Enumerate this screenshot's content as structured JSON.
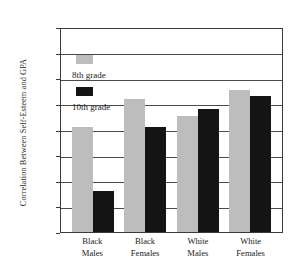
{
  "chart_data": {
    "type": "bar",
    "title": "",
    "xlabel": "",
    "ylabel": "Correlation Between Self-Esteem and GPA",
    "categories": [
      "Black Males",
      "Black Females",
      "White Males",
      "White Females"
    ],
    "category_lines": [
      [
        "Black",
        "Males"
      ],
      [
        "Black",
        "Females"
      ],
      [
        "White",
        "Males"
      ],
      [
        "White",
        "Females"
      ]
    ],
    "series": [
      {
        "name": "8th grade",
        "color": "#bdbdbd",
        "values": [
          0.205,
          0.26,
          0.227,
          0.278
        ]
      },
      {
        "name": "10th grade",
        "color": "#141414",
        "values": [
          0.08,
          0.205,
          0.24,
          0.266
        ]
      }
    ],
    "ylim": [
      0.0,
      0.4
    ],
    "ytick_step": 0.05,
    "ytick_labels": [
      "0.40",
      "0.35",
      "0.30",
      "0.25",
      "0.20",
      "0.15",
      "0.10",
      "0.05",
      "0.00"
    ],
    "ytick_values": [
      0.4,
      0.35,
      0.3,
      0.25,
      0.2,
      0.15,
      0.1,
      0.05,
      0.0
    ],
    "grid": true,
    "legend_position": "upper-left-inside",
    "legend_entries": [
      {
        "label": "8th grade",
        "color": "#bdbdbd"
      },
      {
        "label": "10th grade",
        "color": "#141414"
      }
    ]
  }
}
